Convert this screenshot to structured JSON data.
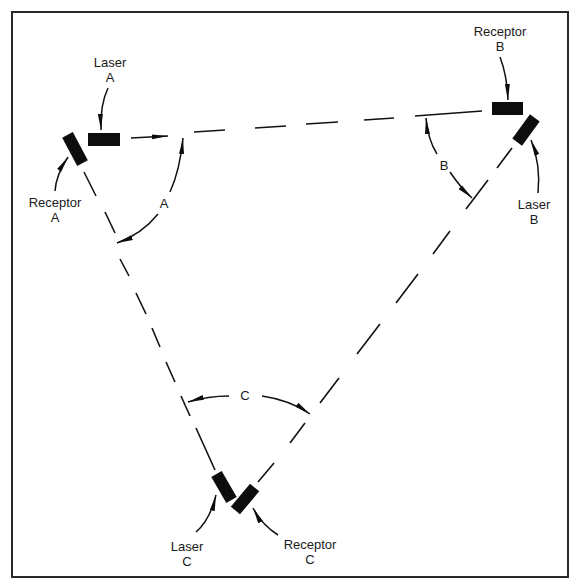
{
  "diagram": {
    "frame": {
      "x": 12,
      "y": 12,
      "width": 556,
      "height": 565,
      "color": "#2a2a2a"
    },
    "devices": [
      {
        "id": "laser-a",
        "label_line1": "Laser",
        "label_line2": "A"
      },
      {
        "id": "receptor-a",
        "label_line1": "Receptor",
        "label_line2": "A"
      },
      {
        "id": "receptor-b",
        "label_line1": "Receptor",
        "label_line2": "B"
      },
      {
        "id": "laser-b",
        "label_line1": "Laser",
        "label_line2": "B"
      },
      {
        "id": "laser-c",
        "label_line1": "Laser",
        "label_line2": "C"
      },
      {
        "id": "receptor-c",
        "label_line1": "Receptor",
        "label_line2": "C"
      }
    ],
    "angles": [
      {
        "id": "angle-a",
        "label": "A"
      },
      {
        "id": "angle-b",
        "label": "B"
      },
      {
        "id": "angle-c",
        "label": "C"
      }
    ],
    "beams": [
      {
        "id": "beam-a-to-b",
        "from": "Laser A",
        "to": "Receptor B",
        "style": "dashed"
      },
      {
        "id": "beam-b-to-c",
        "from": "Laser B",
        "to": "Receptor C",
        "style": "dashed"
      },
      {
        "id": "beam-c-to-a",
        "from": "Laser C",
        "to": "Receptor A",
        "style": "dashed"
      }
    ],
    "colors": {
      "ink": "#0d0d0d",
      "background": "#ffffff"
    }
  }
}
